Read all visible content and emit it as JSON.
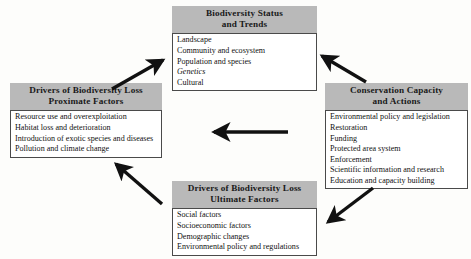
{
  "diagram": {
    "accent_header_color": "#b9b9b9",
    "line_color": "#111111",
    "boxes": {
      "top": {
        "name": "biodiversity-status-and-trends",
        "header_line1": "Biodiversity Status",
        "header_line2": "and Trends",
        "items": [
          "Landscape",
          "Community and ecosystem",
          "Population and species",
          "Genetics",
          "Cultural"
        ]
      },
      "left": {
        "name": "drivers-proximate-factors",
        "header_line1": "Drivers of Biodiversity Loss",
        "header_line2": "Proximate Factors",
        "items": [
          "Resource use and overexploitation",
          "Habitat loss and deterioration",
          "Introduction of exotic species and diseases",
          "Pollution and climate change"
        ]
      },
      "right": {
        "name": "conservation-capacity-and-actions",
        "header_line1": "Conservation Capacity",
        "header_line2": "and Actions",
        "items": [
          "Environmental policy and legislation",
          "Restoration",
          "Funding",
          "Protected area system",
          "Enforcement",
          "Scientific information and research",
          "Education and capacity building"
        ]
      },
      "bottom": {
        "name": "drivers-ultimate-factors",
        "header_line1": "Drivers of Biodiversity Loss",
        "header_line2": "Ultimate Factors",
        "items": [
          "Social factors",
          "Socioeconomic factors",
          "Demographic changes",
          "Environmental policy and regulations"
        ]
      }
    },
    "arrows": [
      {
        "name": "arrow-left-box-to-top-box",
        "from": "drivers-proximate-factors",
        "to": "biodiversity-status-and-trends",
        "direction": "up-right"
      },
      {
        "name": "arrow-right-box-to-top-box",
        "from": "conservation-capacity-and-actions",
        "to": "biodiversity-status-and-trends",
        "direction": "up-left"
      },
      {
        "name": "arrow-right-box-to-left-box",
        "from": "conservation-capacity-and-actions",
        "to": "drivers-proximate-factors",
        "direction": "left"
      },
      {
        "name": "arrow-bottom-box-to-left-box",
        "from": "drivers-ultimate-factors",
        "to": "drivers-proximate-factors",
        "direction": "up-left"
      },
      {
        "name": "arrow-right-box-to-bottom-box",
        "from": "conservation-capacity-and-actions",
        "to": "drivers-ultimate-factors",
        "direction": "down-left"
      }
    ]
  }
}
